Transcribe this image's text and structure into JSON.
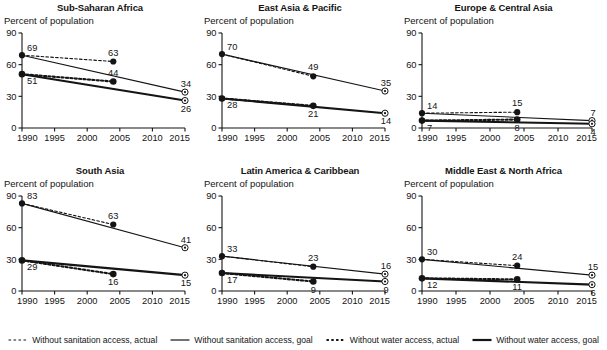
{
  "figure": {
    "axis_label": "Percent of population",
    "x_ticks": [
      "1990",
      "1995",
      "2000",
      "2005",
      "2010",
      "2015"
    ],
    "y_ticks": [
      "90",
      "60",
      "30",
      "0"
    ],
    "colors": {
      "ink": "#141414",
      "line_goal_sanitation": "#3a3a3a",
      "line_goal_water": "#000000",
      "dashed": "#1a1a1a",
      "background": "#ffffff"
    }
  },
  "legend": {
    "items": [
      {
        "label": "Without sanitation access, actual",
        "style": "dashed",
        "weight": "thin",
        "swatch": "dashed-line-swatch"
      },
      {
        "label": "Without sanitation access, goal",
        "style": "solid",
        "weight": "thin",
        "swatch": "solid-thin-line-swatch"
      },
      {
        "label": "Without water access, actual",
        "style": "dashed",
        "weight": "bold",
        "swatch": "dashed-bold-line-swatch"
      },
      {
        "label": "Without water access, goal",
        "style": "solid",
        "weight": "bold",
        "swatch": "solid-bold-line-swatch"
      }
    ]
  },
  "chart_data": {
    "type": "line",
    "title": "",
    "xlabel": "",
    "ylabel": "Percent of population",
    "xlim": [
      1990,
      2015
    ],
    "ylim": [
      0,
      90
    ],
    "yticks": [
      0,
      30,
      60,
      90
    ],
    "xticks": [
      1990,
      1995,
      2000,
      2005,
      2010,
      2015
    ],
    "grid": false,
    "legend_position": "bottom",
    "panels": [
      {
        "title": "Sub-Saharan Africa",
        "series": [
          {
            "name": "Without sanitation access, actual",
            "style": "dashed",
            "weight": "thin",
            "x": [
              1990,
              2004
            ],
            "values": [
              69,
              63
            ],
            "labels": [
              "69",
              "63"
            ]
          },
          {
            "name": "Without sanitation access, goal",
            "style": "solid",
            "weight": "thin",
            "x": [
              1990,
              2015
            ],
            "values": [
              69,
              34
            ],
            "labels": [
              "",
              "34"
            ]
          },
          {
            "name": "Without water access, actual",
            "style": "dashed",
            "weight": "bold",
            "x": [
              1990,
              2004
            ],
            "values": [
              51,
              44
            ],
            "labels": [
              "51",
              "44"
            ]
          },
          {
            "name": "Without water access, goal",
            "style": "solid",
            "weight": "bold",
            "x": [
              1990,
              2015
            ],
            "values": [
              51,
              26
            ],
            "labels": [
              "",
              "26"
            ]
          }
        ]
      },
      {
        "title": "East Asia & Pacific",
        "series": [
          {
            "name": "Without sanitation access, actual",
            "style": "dashed",
            "weight": "thin",
            "x": [
              1990,
              2004
            ],
            "values": [
              70,
              49
            ],
            "labels": [
              "70",
              "49"
            ]
          },
          {
            "name": "Without sanitation access, goal",
            "style": "solid",
            "weight": "thin",
            "x": [
              1990,
              2015
            ],
            "values": [
              70,
              35
            ],
            "labels": [
              "",
              "35"
            ]
          },
          {
            "name": "Without water access, actual",
            "style": "dashed",
            "weight": "bold",
            "x": [
              1990,
              2004
            ],
            "values": [
              28,
              21
            ],
            "labels": [
              "28",
              "21"
            ]
          },
          {
            "name": "Without water access, goal",
            "style": "solid",
            "weight": "bold",
            "x": [
              1990,
              2015
            ],
            "values": [
              28,
              14
            ],
            "labels": [
              "",
              "14"
            ]
          }
        ]
      },
      {
        "title": "Europe & Central Asia",
        "series": [
          {
            "name": "Without sanitation access, actual",
            "style": "dashed",
            "weight": "thin",
            "x": [
              1990,
              2004
            ],
            "values": [
              14,
              15
            ],
            "labels": [
              "14",
              "15"
            ]
          },
          {
            "name": "Without sanitation access, goal",
            "style": "solid",
            "weight": "thin",
            "x": [
              1990,
              2015
            ],
            "values": [
              14,
              7
            ],
            "labels": [
              "",
              "7"
            ]
          },
          {
            "name": "Without water access, actual",
            "style": "dashed",
            "weight": "bold",
            "x": [
              1990,
              2004
            ],
            "values": [
              7,
              8
            ],
            "labels": [
              "7",
              "8"
            ]
          },
          {
            "name": "Without water access, goal",
            "style": "solid",
            "weight": "bold",
            "x": [
              1990,
              2015
            ],
            "values": [
              7,
              4
            ],
            "labels": [
              "",
              "4"
            ]
          }
        ]
      },
      {
        "title": "South Asia",
        "series": [
          {
            "name": "Without sanitation access, actual",
            "style": "dashed",
            "weight": "thin",
            "x": [
              1990,
              2004
            ],
            "values": [
              83,
              63
            ],
            "labels": [
              "83",
              "63"
            ]
          },
          {
            "name": "Without sanitation access, goal",
            "style": "solid",
            "weight": "thin",
            "x": [
              1990,
              2015
            ],
            "values": [
              83,
              41
            ],
            "labels": [
              "",
              "41"
            ]
          },
          {
            "name": "Without water access, actual",
            "style": "dashed",
            "weight": "bold",
            "x": [
              1990,
              2004
            ],
            "values": [
              29,
              16
            ],
            "labels": [
              "29",
              "16"
            ]
          },
          {
            "name": "Without water access, goal",
            "style": "solid",
            "weight": "bold",
            "x": [
              1990,
              2015
            ],
            "values": [
              29,
              15
            ],
            "labels": [
              "",
              "15"
            ]
          }
        ]
      },
      {
        "title": "Latin America & Caribbean",
        "series": [
          {
            "name": "Without sanitation access, actual",
            "style": "dashed",
            "weight": "thin",
            "x": [
              1990,
              2004
            ],
            "values": [
              33,
              23
            ],
            "labels": [
              "33",
              "23"
            ]
          },
          {
            "name": "Without sanitation access, goal",
            "style": "solid",
            "weight": "thin",
            "x": [
              1990,
              2015
            ],
            "values": [
              33,
              16
            ],
            "labels": [
              "",
              "16"
            ]
          },
          {
            "name": "Without water access, actual",
            "style": "dashed",
            "weight": "bold",
            "x": [
              1990,
              2004
            ],
            "values": [
              17,
              9
            ],
            "labels": [
              "17",
              "9"
            ]
          },
          {
            "name": "Without water access, goal",
            "style": "solid",
            "weight": "bold",
            "x": [
              1990,
              2015
            ],
            "values": [
              17,
              9
            ],
            "labels": [
              "",
              "9"
            ]
          }
        ]
      },
      {
        "title": "Middle East & North Africa",
        "series": [
          {
            "name": "Without sanitation access, actual",
            "style": "dashed",
            "weight": "thin",
            "x": [
              1990,
              2004
            ],
            "values": [
              30,
              24
            ],
            "labels": [
              "30",
              "24"
            ]
          },
          {
            "name": "Without sanitation access, goal",
            "style": "solid",
            "weight": "thin",
            "x": [
              1990,
              2015
            ],
            "values": [
              30,
              15
            ],
            "labels": [
              "",
              "15"
            ]
          },
          {
            "name": "Without water access, actual",
            "style": "dashed",
            "weight": "bold",
            "x": [
              1990,
              2004
            ],
            "values": [
              12,
              11
            ],
            "labels": [
              "12",
              "11"
            ]
          },
          {
            "name": "Without water access, goal",
            "style": "solid",
            "weight": "bold",
            "x": [
              1990,
              2015
            ],
            "values": [
              12,
              6
            ],
            "labels": [
              "",
              "6"
            ]
          }
        ]
      }
    ]
  }
}
